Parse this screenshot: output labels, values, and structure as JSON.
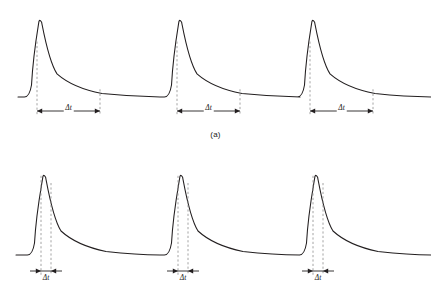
{
  "figure": {
    "background_color": "#ffffff",
    "curve_color": "#231f20",
    "guide_color": "#8e8e8e",
    "dimension_color": "#231f20",
    "panels": [
      {
        "id": "a",
        "caption": "(a)",
        "dimension_labels": [
          "Δt",
          "Δt",
          "Δt"
        ]
      },
      {
        "id": "b",
        "caption": "(b)",
        "dimension_labels": [
          "Δt",
          "Δt",
          "Δt"
        ]
      }
    ]
  },
  "chart_data": {
    "type": "line",
    "title": "",
    "subtitle": "",
    "xlabel": "",
    "ylabel": "",
    "grid": false,
    "legend": "none",
    "panels": [
      {
        "id": "a",
        "caption": "(a)",
        "xlim": [
          0,
          431
        ],
        "ylim": [
          0,
          155
        ],
        "baseline_y": 97,
        "peak_y": 20,
        "curve_start_x": 18,
        "curve_end_x": 431,
        "pulses": [
          {
            "index": 1,
            "rise_start_x": 30,
            "peak_x": 40,
            "peak_height": 77,
            "decay_tail_x": 160,
            "guide_x": [
              37,
              100
            ],
            "dimension_label": "Δt",
            "dimension_y": 111,
            "dimension_width": 63
          },
          {
            "index": 2,
            "rise_start_x": 170,
            "peak_x": 180,
            "peak_height": 77,
            "decay_tail_x": 300,
            "guide_x": [
              177,
              240
            ],
            "dimension_label": "Δt",
            "dimension_y": 111,
            "dimension_width": 63
          },
          {
            "index": 3,
            "rise_start_x": 303,
            "peak_x": 313,
            "peak_height": 77,
            "decay_tail_x": 431,
            "guide_x": [
              310,
              373
            ],
            "dimension_label": "Δt",
            "dimension_y": 111,
            "dimension_width": 63
          }
        ]
      },
      {
        "id": "b",
        "caption": "(b)",
        "xlim": [
          0,
          431
        ],
        "ylim": [
          0,
          152
        ],
        "baseline_y": 100,
        "peak_y": 20,
        "curve_start_x": 16,
        "curve_end_x": 431,
        "pulses": [
          {
            "index": 1,
            "rise_start_x": 33,
            "peak_x": 44,
            "peak_height": 80,
            "decay_tail_x": 160,
            "guide_x": [
              41,
              51
            ],
            "dimension_label": "Δt",
            "dimension_y": 116,
            "dimension_width": 10
          },
          {
            "index": 2,
            "rise_start_x": 170,
            "peak_x": 181,
            "peak_height": 80,
            "decay_tail_x": 300,
            "guide_x": [
              178,
              188
            ],
            "dimension_label": "Δt",
            "dimension_y": 116,
            "dimension_width": 10
          },
          {
            "index": 3,
            "rise_start_x": 305,
            "peak_x": 316,
            "peak_height": 80,
            "decay_tail_x": 431,
            "guide_x": [
              313,
              323
            ],
            "dimension_label": "Δt",
            "dimension_y": 116,
            "dimension_width": 10
          }
        ]
      }
    ]
  }
}
